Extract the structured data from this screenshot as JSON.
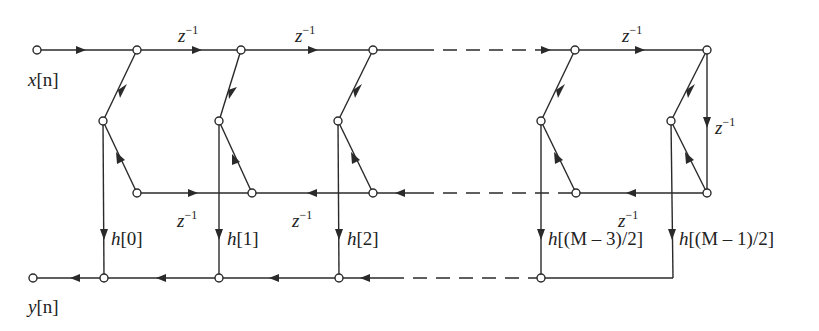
{
  "diagram": {
    "type": "signal-flow-graph",
    "colors": {
      "line": "#2a2a2a",
      "background": "#ffffff"
    },
    "input_label": {
      "var": "x",
      "arg": "[n]"
    },
    "output_label": {
      "var": "y",
      "arg": "[n]"
    },
    "delay": {
      "base": "z",
      "exp": "−1"
    },
    "coefficients": [
      {
        "var": "h",
        "arg": "[0]"
      },
      {
        "var": "h",
        "arg": "[1]"
      },
      {
        "var": "h",
        "arg": "[2]"
      },
      {
        "var": "h",
        "arg": "[(M – 3)/2]"
      },
      {
        "var": "h",
        "arg": "[(M – 1)/2]"
      }
    ],
    "delay_labels": [
      {
        "id": "top-1",
        "base": "z",
        "exp": "−1"
      },
      {
        "id": "top-2",
        "base": "z",
        "exp": "−1"
      },
      {
        "id": "top-last",
        "base": "z",
        "exp": "−1"
      },
      {
        "id": "right-vertical",
        "base": "z",
        "exp": "−1"
      },
      {
        "id": "bottom-1",
        "base": "z",
        "exp": "−1"
      },
      {
        "id": "bottom-2",
        "base": "z",
        "exp": "−1"
      },
      {
        "id": "bottom-last",
        "base": "z",
        "exp": "−1"
      }
    ]
  }
}
